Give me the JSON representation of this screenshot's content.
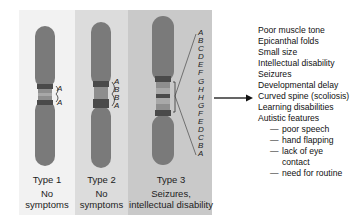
{
  "figure": {
    "chromosomes": [
      {
        "type_label": "Type 1",
        "effect": [
          "No",
          "symptoms"
        ],
        "segment_letters": [
          "A",
          "A"
        ]
      },
      {
        "type_label": "Type 2",
        "effect": [
          "No",
          "symptoms"
        ],
        "segment_letters": [
          "A",
          "B",
          "B",
          "A"
        ]
      },
      {
        "type_label": "Type 3",
        "effect": [
          "Seizures,",
          "intellectual disability"
        ],
        "segment_letters": [
          "A",
          "B",
          "C",
          "D",
          "E",
          "F",
          "G",
          "H",
          "H",
          "G",
          "F",
          "E",
          "D",
          "C",
          "B",
          "A"
        ]
      }
    ],
    "arrow": "right-arrow",
    "symptoms": {
      "items": [
        "Poor muscle tone",
        "Epicanthal folds",
        "Small size",
        "Intellectual disability",
        "Seizures",
        "Developmental delay",
        "Curved spine (scoliosis)",
        "Learning disabilities",
        "Autistic features"
      ],
      "autistic_subitems": [
        "poor speech",
        "hand flapping",
        "lack of eye",
        "need for routine"
      ],
      "autistic_subitem_continuation": "contact",
      "dash": "—"
    },
    "colors": {
      "chromosome": "#7a7a7a",
      "band_dark": "#4a4a4a",
      "band_light": "#a8a8a8",
      "panel1": "#f2f2f2",
      "panel2": "#dcdcdc",
      "panel3": "#c9c9c9"
    }
  }
}
